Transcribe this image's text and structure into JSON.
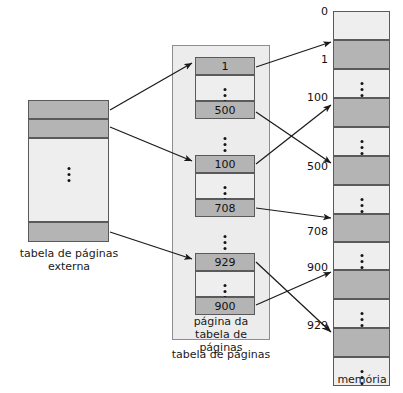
{
  "diagram": {
    "colors": {
      "frame_fill": "#b4b4b4",
      "empty_fill": "#eeeeee",
      "container_fill": "#ececec",
      "stroke": "#5a5a5a",
      "arrow": "#1a1a1a",
      "text": "#111111"
    }
  },
  "outer_table": {
    "caption_line1": "tabela de páginas",
    "caption_line2": "externa",
    "entries": [
      {
        "kind": "frame",
        "value": ""
      },
      {
        "kind": "frame",
        "value": ""
      },
      {
        "kind": "ellipsis",
        "value": ""
      },
      {
        "kind": "frame",
        "value": ""
      }
    ]
  },
  "page_table": {
    "caption_inner_line1": "página da",
    "caption_inner_line2": "tabela de páginas",
    "caption_outer": "tabela de páginas",
    "entries": [
      {
        "kind": "frame",
        "value": "1"
      },
      {
        "kind": "ellipsis",
        "value": ""
      },
      {
        "kind": "frame",
        "value": "500"
      },
      {
        "kind": "ellipsis",
        "value": ""
      },
      {
        "kind": "frame",
        "value": "100"
      },
      {
        "kind": "ellipsis",
        "value": ""
      },
      {
        "kind": "frame",
        "value": "708"
      },
      {
        "kind": "ellipsis",
        "value": ""
      },
      {
        "kind": "frame",
        "value": "929"
      },
      {
        "kind": "ellipsis",
        "value": ""
      },
      {
        "kind": "frame",
        "value": "900"
      }
    ]
  },
  "memory": {
    "caption": "memória",
    "address_labels": [
      "0",
      "1",
      "100",
      "500",
      "708",
      "900",
      "929"
    ],
    "blocks": [
      {
        "kind": "empty"
      },
      {
        "kind": "frame"
      },
      {
        "kind": "ellipsis"
      },
      {
        "kind": "frame"
      },
      {
        "kind": "ellipsis"
      },
      {
        "kind": "frame"
      },
      {
        "kind": "ellipsis"
      },
      {
        "kind": "frame"
      },
      {
        "kind": "ellipsis"
      },
      {
        "kind": "frame"
      },
      {
        "kind": "ellipsis"
      },
      {
        "kind": "frame"
      },
      {
        "kind": "ellipsis"
      }
    ]
  },
  "mappings": [
    {
      "from": "outer entry 1",
      "to": "page table entry 1"
    },
    {
      "from": "outer entry 2",
      "to": "page table entry 100"
    },
    {
      "from": "outer entry last",
      "to": "page table entry 929"
    },
    {
      "from": "page table 1",
      "to": "memory frame 1"
    },
    {
      "from": "page table 500",
      "to": "memory frame 500"
    },
    {
      "from": "page table 100",
      "to": "memory frame 100"
    },
    {
      "from": "page table 708",
      "to": "memory frame 708"
    },
    {
      "from": "page table 929",
      "to": "memory frame 929"
    },
    {
      "from": "page table 900",
      "to": "memory frame 900"
    }
  ]
}
